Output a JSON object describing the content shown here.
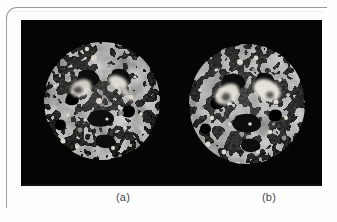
{
  "page": {
    "background_color": "#fdfdfd",
    "rule_color": "#9a9a9a"
  },
  "figure": {
    "panel_background": "#050505",
    "panels": [
      {
        "id": "a",
        "caption": "(a)",
        "modality": "mri-brain-axial-slice",
        "tissue_color": "#6a6a6a",
        "lesion_color": "#e8e8e4"
      },
      {
        "id": "b",
        "caption": "(b)",
        "modality": "mri-brain-axial-slice",
        "tissue_color": "#6e6e6e",
        "lesion_color": "#efefe9"
      }
    ]
  },
  "captions": {
    "a": "(a)",
    "b": "(b)"
  }
}
